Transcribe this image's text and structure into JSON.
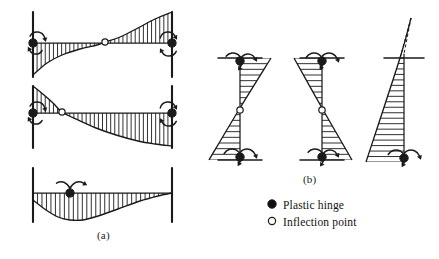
{
  "figure": {
    "background_color": "#ffffff",
    "ink_color": "#1a1a1a",
    "panels": [
      {
        "id": "a",
        "label": "(a)",
        "description": "Beam moment diagrams",
        "label_x": 97,
        "label_y": 229
      },
      {
        "id": "b",
        "label": "(b)",
        "description": "Column moment diagrams",
        "label_x": 303,
        "label_y": 173
      }
    ]
  },
  "legend": {
    "items": [
      {
        "marker": "filled-circle",
        "icon_name": "plastic-hinge-icon",
        "label": "Plastic hinge",
        "fill": "#111111"
      },
      {
        "marker": "open-circle",
        "icon_name": "inflection-point-icon",
        "label": "Inflection point",
        "fill": "#ffffff"
      }
    ]
  },
  "chart_data": {
    "type": "line",
    "xlabel": "",
    "ylabel": "",
    "grid": false,
    "legend_position": "bottom-right",
    "units": "dimensionless moment",
    "beams": [
      {
        "name": "beam-1",
        "caption_group": "a",
        "axis_y": 43,
        "span_x": [
          33,
          172
        ],
        "supports": [
          {
            "x": 33,
            "y_top": 12,
            "y_bottom": 77
          },
          {
            "x": 172,
            "y_top": 12,
            "y_bottom": 77
          }
        ],
        "moment_curve": [
          [
            33,
            75
          ],
          [
            47,
            63
          ],
          [
            62,
            55
          ],
          [
            80,
            49
          ],
          [
            97,
            45
          ],
          [
            105,
            42
          ],
          [
            120,
            37
          ],
          [
            138,
            28
          ],
          [
            155,
            19
          ],
          [
            172,
            12
          ]
        ],
        "hatch_count": 34,
        "hinges": [
          {
            "type": "plastic",
            "x": 33,
            "y": 43,
            "rotation": "ccw"
          },
          {
            "type": "plastic",
            "x": 172,
            "y": 43,
            "rotation": "cw"
          }
        ],
        "inflection_points": [
          {
            "x": 105,
            "y": 42
          }
        ]
      },
      {
        "name": "beam-2",
        "caption_group": "a",
        "axis_y": 113,
        "span_x": [
          33,
          172
        ],
        "supports": [
          {
            "x": 33,
            "y_top": 86,
            "y_bottom": 148
          },
          {
            "x": 172,
            "y_top": 86,
            "y_bottom": 148
          }
        ],
        "moment_curve": [
          [
            33,
            86
          ],
          [
            44,
            95
          ],
          [
            53,
            103
          ],
          [
            62,
            112
          ],
          [
            78,
            120
          ],
          [
            96,
            128
          ],
          [
            116,
            135
          ],
          [
            138,
            141
          ],
          [
            155,
            144
          ],
          [
            172,
            146
          ]
        ],
        "hatch_count": 34,
        "hinges": [
          {
            "type": "plastic",
            "x": 33,
            "y": 113,
            "rotation": "ccw"
          },
          {
            "type": "plastic",
            "x": 172,
            "y": 113,
            "rotation": "cw"
          }
        ],
        "inflection_points": [
          {
            "x": 62,
            "y": 112
          }
        ]
      },
      {
        "name": "beam-3",
        "caption_group": "a",
        "axis_y": 193,
        "span_x": [
          33,
          172
        ],
        "supports": [
          {
            "x": 33,
            "y_top": 168,
            "y_bottom": 222
          },
          {
            "x": 172,
            "y_top": 168,
            "y_bottom": 222
          }
        ],
        "moment_curve": [
          [
            33,
            200
          ],
          [
            46,
            210
          ],
          [
            58,
            217
          ],
          [
            70,
            220
          ],
          [
            83,
            220
          ],
          [
            98,
            216
          ],
          [
            118,
            209
          ],
          [
            140,
            201
          ],
          [
            158,
            196
          ],
          [
            172,
            193
          ]
        ],
        "hatch_count": 31,
        "hinges": [
          {
            "type": "plastic",
            "x": 70,
            "y": 193,
            "rotation": "both"
          }
        ],
        "inflection_points": []
      }
    ],
    "columns": [
      {
        "name": "column-1",
        "caption_group": "b",
        "axis_x": 240,
        "span_y": [
          58,
          160
        ],
        "ground_lines": [
          {
            "x_start": 218,
            "x_end": 262,
            "y": 58
          },
          {
            "x_start": 218,
            "x_end": 262,
            "y": 160
          }
        ],
        "moment_profile": [
          [
            271,
            58
          ],
          [
            240,
            108
          ],
          [
            209,
            160
          ]
        ],
        "hatch_count": 18,
        "hinges": [
          {
            "type": "plastic",
            "x": 240,
            "y": 61,
            "rotation": "ccw"
          },
          {
            "type": "plastic",
            "x": 240,
            "y": 157,
            "rotation": "cw"
          }
        ],
        "inflection_points": [
          {
            "x": 240,
            "y": 110
          }
        ]
      },
      {
        "name": "column-2",
        "caption_group": "b",
        "axis_x": 322,
        "span_y": [
          58,
          160
        ],
        "ground_lines": [
          {
            "x_start": 300,
            "x_end": 344,
            "y": 58
          },
          {
            "x_start": 300,
            "x_end": 344,
            "y": 160
          }
        ],
        "moment_profile": [
          [
            294,
            58
          ],
          [
            322,
            108
          ],
          [
            352,
            160
          ]
        ],
        "hatch_count": 18,
        "hinges": [
          {
            "type": "plastic",
            "x": 322,
            "y": 61,
            "rotation": "cw"
          },
          {
            "type": "plastic",
            "x": 322,
            "y": 157,
            "rotation": "ccw"
          }
        ],
        "inflection_points": [
          {
            "x": 322,
            "y": 110
          }
        ]
      },
      {
        "name": "column-3",
        "caption_group": "b",
        "axis_x": 404,
        "span_y": [
          58,
          162
        ],
        "ground_lines": [
          {
            "x_start": 384,
            "x_end": 424,
            "y": 58
          }
        ],
        "apex": {
          "x": 411,
          "y": 18
        },
        "dashed_extension": true,
        "moment_profile": [
          [
            411,
            18
          ],
          [
            400,
            58
          ],
          [
            366,
            162
          ]
        ],
        "hatch_count": 19,
        "hinges": [
          {
            "type": "plastic",
            "x": 404,
            "y": 158,
            "rotation": "cw"
          }
        ],
        "inflection_points": []
      }
    ]
  }
}
